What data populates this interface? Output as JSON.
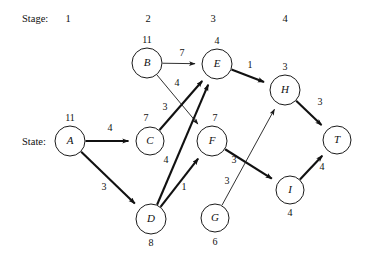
{
  "labels": {
    "stage_axis": "Stage:",
    "state_axis": "State:"
  },
  "stages": [
    {
      "label": "1",
      "x": 68
    },
    {
      "label": "2",
      "x": 148
    },
    {
      "label": "3",
      "x": 213
    },
    {
      "label": "4",
      "x": 285
    }
  ],
  "chart_data": {
    "type": "diagram",
    "title": "",
    "diagram_kind": "dynamic-programming shortest-path network",
    "nodes": [
      {
        "id": "A",
        "letter": "A",
        "value": "11",
        "cx": 70,
        "cy": 141,
        "r": 15,
        "value_dx": 0,
        "value_dy": -20
      },
      {
        "id": "B",
        "letter": "B",
        "value": "11",
        "cx": 147,
        "cy": 63,
        "r": 15,
        "value_dx": 0,
        "value_dy": -20
      },
      {
        "id": "C",
        "letter": "C",
        "value": "7",
        "cx": 150,
        "cy": 141,
        "r": 14,
        "value_dx": -4,
        "value_dy": -20
      },
      {
        "id": "D",
        "letter": "D",
        "value": "8",
        "cx": 151,
        "cy": 219,
        "r": 15,
        "value_dx": 0,
        "value_dy": 27
      },
      {
        "id": "E",
        "letter": "E",
        "value": "4",
        "cx": 217,
        "cy": 64,
        "r": 15,
        "value_dx": 0,
        "value_dy": -20
      },
      {
        "id": "F",
        "letter": "F",
        "value": "7",
        "cx": 212,
        "cy": 141,
        "r": 15,
        "value_dx": 3,
        "value_dy": -20
      },
      {
        "id": "G",
        "letter": "G",
        "value": "6",
        "cx": 215,
        "cy": 218,
        "r": 14,
        "value_dx": 0,
        "value_dy": 27
      },
      {
        "id": "H",
        "letter": "H",
        "value": "3",
        "cx": 285,
        "cy": 90,
        "r": 15,
        "value_dx": 0,
        "value_dy": -20
      },
      {
        "id": "I",
        "letter": "I",
        "value": "4",
        "cx": 290,
        "cy": 190,
        "r": 14,
        "value_dx": 0,
        "value_dy": 26
      },
      {
        "id": "T",
        "letter": "T",
        "value": "",
        "cx": 337,
        "cy": 140,
        "r": 14,
        "value_dx": 0,
        "value_dy": 26
      }
    ],
    "edges": [
      {
        "from": "A",
        "to": "C",
        "weight": "4",
        "emphasis": "thick",
        "label_x": 110,
        "label_y": 131
      },
      {
        "from": "A",
        "to": "D",
        "weight": "3",
        "emphasis": "thick",
        "label_x": 104,
        "label_y": 190
      },
      {
        "from": "B",
        "to": "E",
        "weight": "7",
        "emphasis": "thin",
        "label_x": 182,
        "label_y": 56
      },
      {
        "from": "B",
        "to": "F",
        "weight": "4",
        "emphasis": "thin",
        "label_x": 177,
        "label_y": 86
      },
      {
        "from": "C",
        "to": "E",
        "weight": "3",
        "emphasis": "thick",
        "label_x": 165,
        "label_y": 110
      },
      {
        "from": "D",
        "to": "E",
        "weight": "4",
        "emphasis": "thick",
        "label_x": 166,
        "label_y": 163
      },
      {
        "from": "D",
        "to": "F",
        "weight": "1",
        "emphasis": "thick",
        "label_x": 184,
        "label_y": 190
      },
      {
        "from": "E",
        "to": "H",
        "weight": "1",
        "emphasis": "thick",
        "label_x": 250,
        "label_y": 68
      },
      {
        "from": "F",
        "to": "I",
        "weight": "3",
        "emphasis": "thick",
        "label_x": 234,
        "label_y": 163
      },
      {
        "from": "G",
        "to": "H",
        "weight": "3",
        "emphasis": "thin",
        "label_x": 227,
        "label_y": 184
      },
      {
        "from": "H",
        "to": "T",
        "weight": "3",
        "emphasis": "thick",
        "label_x": 320,
        "label_y": 105
      },
      {
        "from": "I",
        "to": "T",
        "weight": "4",
        "emphasis": "thick",
        "label_x": 322,
        "label_y": 170
      }
    ]
  }
}
